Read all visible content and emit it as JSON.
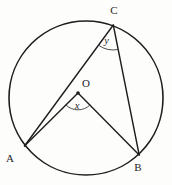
{
  "figure": {
    "labels": {
      "point_c": "C",
      "center": "O",
      "point_a": "A",
      "point_b": "B",
      "central_angle": "x",
      "inscribed_angle": "y"
    },
    "colors": {
      "line": "#1e1e1e",
      "background": "#ffffff"
    }
  }
}
